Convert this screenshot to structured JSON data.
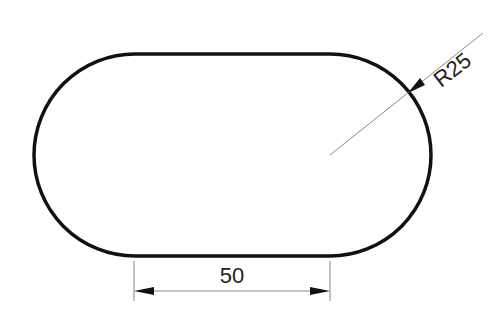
{
  "drawing": {
    "shape": "slot",
    "outline_color": "#111111",
    "dimension_color": "#777777",
    "linear_dimension": {
      "label": "50"
    },
    "radius_dimension": {
      "label": "R25"
    }
  }
}
